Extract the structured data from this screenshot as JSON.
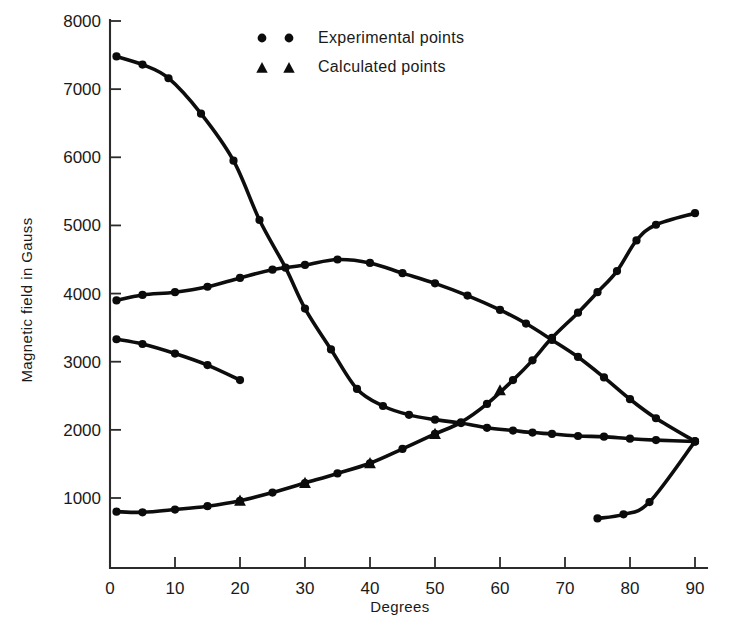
{
  "chart_data": {
    "type": "line",
    "title": "",
    "xlabel": "Degrees",
    "ylabel": "Magnetic field in Gauss",
    "xlim": [
      0,
      92
    ],
    "ylim": [
      0,
      8000
    ],
    "xticks": [
      0,
      10,
      20,
      30,
      40,
      50,
      60,
      70,
      80,
      90
    ],
    "xtick_labels": [
      "0",
      "10",
      "20",
      "30",
      "40",
      "50",
      "60",
      "70",
      "80",
      "90"
    ],
    "yticks": [
      1000,
      2000,
      3000,
      4000,
      5000,
      6000,
      7000,
      8000
    ],
    "ytick_labels": [
      "1000",
      "2000",
      "3000",
      "4000",
      "5000",
      "6000",
      "7000",
      "8000"
    ],
    "grid": false,
    "legend_position": "top-center",
    "legend": [
      {
        "label": "Experimental points",
        "marker": "circle",
        "marker_count": 2
      },
      {
        "label": "Calculated points",
        "marker": "triangle",
        "marker_count": 2
      }
    ],
    "series": [
      {
        "name": "descending-branch",
        "marker": "circle",
        "points": [
          [
            1,
            7480
          ],
          [
            5,
            7360
          ],
          [
            9,
            7160
          ],
          [
            14,
            6640
          ],
          [
            19,
            5950
          ],
          [
            23,
            5080
          ],
          [
            27,
            4380
          ],
          [
            30,
            3780
          ],
          [
            34,
            3180
          ],
          [
            38,
            2600
          ],
          [
            42,
            2350
          ],
          [
            46,
            2220
          ],
          [
            50,
            2150
          ],
          [
            54,
            2100
          ],
          [
            58,
            2030
          ],
          [
            62,
            1990
          ],
          [
            65,
            1960
          ],
          [
            68,
            1940
          ],
          [
            72,
            1910
          ],
          [
            76,
            1900
          ],
          [
            80,
            1870
          ],
          [
            84,
            1850
          ],
          [
            90,
            1830
          ]
        ]
      },
      {
        "name": "arch-branch",
        "marker": "circle",
        "points": [
          [
            1,
            3900
          ],
          [
            5,
            3980
          ],
          [
            10,
            4020
          ],
          [
            15,
            4100
          ],
          [
            20,
            4230
          ],
          [
            25,
            4350
          ],
          [
            30,
            4420
          ],
          [
            35,
            4500
          ],
          [
            40,
            4450
          ],
          [
            45,
            4300
          ],
          [
            50,
            4150
          ],
          [
            55,
            3970
          ],
          [
            60,
            3760
          ],
          [
            64,
            3560
          ],
          [
            68,
            3320
          ],
          [
            72,
            3070
          ],
          [
            76,
            2770
          ],
          [
            80,
            2450
          ],
          [
            84,
            2170
          ],
          [
            90,
            1830
          ]
        ]
      },
      {
        "name": "rising-branch",
        "marker": "circle",
        "points": [
          [
            1,
            800
          ],
          [
            5,
            790
          ],
          [
            10,
            830
          ],
          [
            15,
            880
          ],
          [
            20,
            960
          ],
          [
            25,
            1080
          ],
          [
            30,
            1220
          ],
          [
            35,
            1360
          ],
          [
            40,
            1510
          ],
          [
            45,
            1720
          ],
          [
            50,
            1940
          ],
          [
            54,
            2110
          ],
          [
            58,
            2380
          ],
          [
            62,
            2730
          ],
          [
            65,
            3020
          ],
          [
            68,
            3350
          ],
          [
            72,
            3720
          ],
          [
            75,
            4020
          ],
          [
            78,
            4330
          ],
          [
            81,
            4780
          ],
          [
            84,
            5010
          ],
          [
            90,
            5180
          ]
        ]
      },
      {
        "name": "calculated-overlay",
        "marker": "triangle",
        "points": [
          [
            20,
            960
          ],
          [
            30,
            1220
          ],
          [
            40,
            1510
          ],
          [
            50,
            1940
          ],
          [
            60,
            2580
          ]
        ]
      },
      {
        "name": "short-upper-left-branch",
        "marker": "circle",
        "points": [
          [
            1,
            3330
          ],
          [
            5,
            3260
          ],
          [
            10,
            3120
          ],
          [
            15,
            2950
          ],
          [
            20,
            2730
          ]
        ]
      },
      {
        "name": "short-lower-right-branch",
        "marker": "circle",
        "points": [
          [
            75,
            700
          ],
          [
            79,
            760
          ],
          [
            83,
            940
          ],
          [
            90,
            1830
          ]
        ]
      }
    ]
  }
}
